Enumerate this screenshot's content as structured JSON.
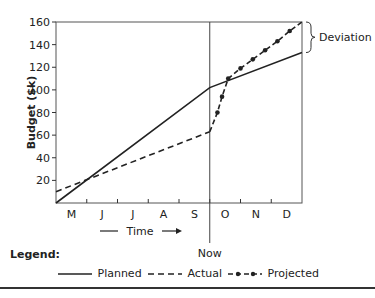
{
  "chart_data": {
    "type": "line",
    "title": "",
    "xlabel": "Time",
    "ylabel": "Budget ($k)",
    "categories": [
      "M",
      "J",
      "J",
      "A",
      "S",
      "O",
      "N",
      "D"
    ],
    "ylim": [
      0,
      160
    ],
    "yticks": [
      20,
      40,
      60,
      80,
      100,
      120,
      140,
      160
    ],
    "grid": false,
    "series": [
      {
        "name": "Planned",
        "style": "solid",
        "points": [
          [
            0,
            0
          ],
          [
            5,
            102
          ],
          [
            8,
            133
          ]
        ]
      },
      {
        "name": "Actual",
        "style": "dashed",
        "points": [
          [
            0,
            10
          ],
          [
            5,
            63
          ]
        ]
      },
      {
        "name": "Projected",
        "style": "dash-dot-markers",
        "points": [
          [
            5,
            63
          ],
          [
            5.25,
            80
          ],
          [
            5.4,
            94
          ],
          [
            5.6,
            110
          ],
          [
            6.0,
            119
          ],
          [
            6.4,
            127
          ],
          [
            6.8,
            135
          ],
          [
            7.2,
            143
          ],
          [
            7.6,
            152
          ],
          [
            8,
            160
          ]
        ]
      }
    ],
    "annotations": [
      {
        "text": "Now",
        "x": 5,
        "type": "vertical-line"
      },
      {
        "text": "Deviation",
        "type": "brace",
        "between": [
          "Planned end",
          "Projected end"
        ]
      }
    ],
    "legend_position": "bottom"
  },
  "labels": {
    "y_axis_title": "Budget ($k)",
    "x_axis_title": "Time",
    "now": "Now",
    "deviation": "Deviation",
    "legend_title": "Legend:",
    "legend_planned": "Planned",
    "legend_actual": "Actual",
    "legend_projected": "Projected"
  }
}
